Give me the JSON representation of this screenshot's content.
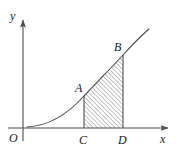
{
  "figure": {
    "kind": "calculus-area-under-curve-diagram",
    "background_color": "#ffffff",
    "stroke_color": "#4d4d4d",
    "hatch_color": "#808080",
    "label_color": "#1a1a1a"
  },
  "axes": {
    "x_label": "x",
    "y_label": "y",
    "origin_label": "O",
    "x_axis_y": 128,
    "y_axis_x": 23,
    "x_axis_start": 8,
    "x_axis_end": 171,
    "y_axis_top": 13,
    "y_axis_bottom": 141
  },
  "labels": {
    "origin": {
      "text": "O",
      "x": 11,
      "y": 142
    },
    "x": {
      "text": "x",
      "x": 160,
      "y": 143
    },
    "y": {
      "text": "y",
      "x": 10,
      "y": 20
    },
    "A": {
      "text": "A",
      "x": 76,
      "y": 92
    },
    "B": {
      "text": "B",
      "x": 115,
      "y": 50
    },
    "C": {
      "text": "C",
      "x": 79,
      "y": 144
    },
    "D": {
      "text": "D",
      "x": 118,
      "y": 144
    }
  },
  "points": {
    "A": {
      "x": 84,
      "y": 96
    },
    "B": {
      "x": 123,
      "y": 55
    },
    "C": {
      "x": 84,
      "y": 128
    },
    "D": {
      "x": 123,
      "y": 128
    }
  },
  "curve": {
    "description": "increasing convex curve from near origin rising to upper right past B",
    "path": "M 27 127 C 48 126, 66 116, 84 96 C 100 79, 112 67, 123 55 C 132 45, 141 36, 149 29"
  },
  "shaded_region": {
    "description": "region bounded by curve AB above, x-axis below, and vertical segments CA and DB",
    "path": "M 84 128 L 84 96 C 100 79, 112 67, 123 55 L 123 128 Z",
    "hatch_angle_deg": 45,
    "hatch_spacing_px": 3
  },
  "verticals": [
    {
      "name": "CA",
      "x": 84,
      "y_top": 96,
      "y_bottom": 128
    },
    {
      "name": "DB",
      "x": 123,
      "y_top": 55,
      "y_bottom": 128
    }
  ]
}
